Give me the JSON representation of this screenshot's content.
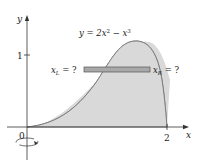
{
  "figure": {
    "equation_label": "y = 2x² − x³",
    "equation_parts": {
      "lhs": "y = 2x",
      "exp1": "2",
      "mid": " − x",
      "exp2": "3"
    },
    "axis_x_label": "x",
    "axis_y_label": "y",
    "tick_x": "2",
    "tick_y": "1",
    "origin_label": "0",
    "left_label": {
      "base": "x",
      "sub": "L",
      "rest": " = ?"
    },
    "right_label": {
      "base": "x",
      "sub": "R",
      "rest": " = ?"
    },
    "colors": {
      "region_fill": "#d9d9d9",
      "strip_fill": "#a9a9a9",
      "curve": "#777777",
      "axis": "#333333"
    },
    "rotation_axis": "y-axis"
  }
}
